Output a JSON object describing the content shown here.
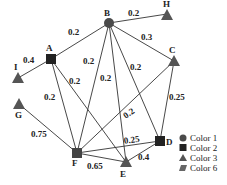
{
  "diagram": {
    "type": "weighted-graph",
    "nodes": [
      {
        "id": "A",
        "shape": "square",
        "color_group": "Color 2"
      },
      {
        "id": "B",
        "shape": "circle",
        "color_group": "Color 1"
      },
      {
        "id": "C",
        "shape": "triangle",
        "color_group": "Color 3"
      },
      {
        "id": "D",
        "shape": "square",
        "color_group": "Color 2"
      },
      {
        "id": "E",
        "shape": "triangle",
        "color_group": "Color 3"
      },
      {
        "id": "F",
        "shape": "square",
        "color_group": "Color 2"
      },
      {
        "id": "G",
        "shape": "triangle",
        "color_group": "Color 3"
      },
      {
        "id": "H",
        "shape": "triangle",
        "color_group": "Color 3"
      },
      {
        "id": "I",
        "shape": "triangle",
        "color_group": "Color 3"
      }
    ],
    "edges": [
      {
        "from": "A",
        "to": "B",
        "weight": "0.2"
      },
      {
        "from": "A",
        "to": "I",
        "weight": "0.4"
      },
      {
        "from": "A",
        "to": "F",
        "weight": "0.2"
      },
      {
        "from": "A",
        "to": "E",
        "weight": "0.2"
      },
      {
        "from": "B",
        "to": "H",
        "weight": "0.2"
      },
      {
        "from": "B",
        "to": "C",
        "weight": "0.3"
      },
      {
        "from": "B",
        "to": "F",
        "weight": "0.2"
      },
      {
        "from": "B",
        "to": "E",
        "weight": "0.2"
      },
      {
        "from": "B",
        "to": "D",
        "weight": "0.2"
      },
      {
        "from": "C",
        "to": "F",
        "weight": "0.2"
      },
      {
        "from": "C",
        "to": "D",
        "weight": "0.25"
      },
      {
        "from": "G",
        "to": "F",
        "weight": "0.75"
      },
      {
        "from": "F",
        "to": "D",
        "weight": "0.25"
      },
      {
        "from": "F",
        "to": "E",
        "weight": "0.65"
      },
      {
        "from": "E",
        "to": "D",
        "weight": "0.4"
      }
    ],
    "legend": [
      {
        "shape": "circle",
        "label": "Color 1"
      },
      {
        "shape": "square",
        "label": "Color 2"
      },
      {
        "shape": "triangle",
        "label": "Color 3"
      },
      {
        "shape": "parallelogram",
        "label": "Color 6"
      }
    ],
    "colors": {
      "node_fill": "#4a4a4a",
      "node_square": "#222222",
      "edge": "#333333",
      "background": "#ffffff"
    }
  }
}
